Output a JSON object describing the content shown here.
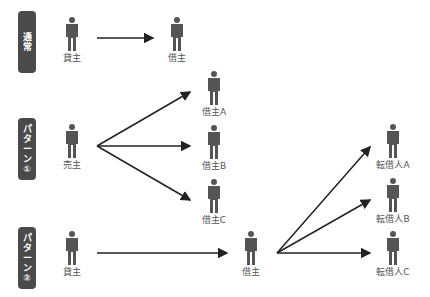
{
  "colors": {
    "badge": "#4a4a4a",
    "figure": "#555555",
    "arrow": "#222222",
    "text": "#555555"
  },
  "rows": {
    "normal": {
      "badge": [
        "通",
        "常"
      ],
      "from": "貸主",
      "to": "借主"
    },
    "pattern1": {
      "badge": [
        "パ",
        "タ",
        "ー",
        "ン",
        "①"
      ],
      "from": "売主",
      "to": [
        "借主A",
        "借主B",
        "借主C"
      ]
    },
    "pattern2": {
      "badge": [
        "パ",
        "タ",
        "ー",
        "ン",
        "②"
      ],
      "from": "貸主",
      "middle": "借主",
      "to": [
        "転借人A",
        "転借人B",
        "転借人C"
      ]
    }
  },
  "icons": {
    "person": "person-icon",
    "arrow": "arrow-icon"
  }
}
